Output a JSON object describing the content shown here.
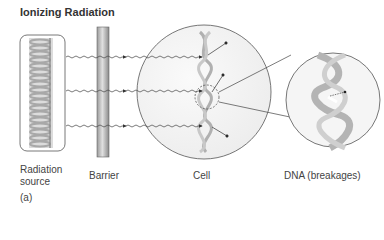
{
  "figure": {
    "title": "Ionizing Radiation",
    "panel_label": "(a)",
    "labels": {
      "source_line1": "Radiation",
      "source_line2": "source",
      "barrier": "Barrier",
      "cell": "Cell",
      "dna": "DNA (breakages)"
    },
    "colors": {
      "outline": "#555555",
      "barrier_dark": "#8a8a8a",
      "barrier_light": "#d8d8d8",
      "coil": "#b8b8b8",
      "cell_fill": "#f4f4f4",
      "wave": "#444444"
    }
  }
}
